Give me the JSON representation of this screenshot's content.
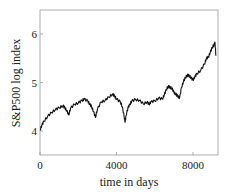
{
  "chart_data": {
    "type": "line",
    "title": "",
    "xlabel": "time in days",
    "ylabel": "S&P500 log index",
    "xlim": [
      0,
      9200
    ],
    "ylim": [
      3.5,
      6.5
    ],
    "xticks": [
      0,
      4000,
      8000
    ],
    "xtick_labels": [
      "0",
      "4000",
      "8000"
    ],
    "yticks": [
      4,
      5,
      6
    ],
    "ytick_labels": [
      "4",
      "5",
      "6"
    ],
    "grid": false,
    "legend": null,
    "series": [
      {
        "name": "S&P500 log index",
        "color": "#111111",
        "x": [
          0,
          100,
          200,
          400,
          600,
          800,
          1000,
          1200,
          1300,
          1400,
          1500,
          1600,
          1800,
          2000,
          2200,
          2300,
          2500,
          2600,
          2700,
          2800,
          2900,
          3000,
          3200,
          3400,
          3600,
          3800,
          3900,
          4000,
          4200,
          4300,
          4400,
          4450,
          4500,
          4600,
          4700,
          4800,
          5000,
          5200,
          5400,
          5600,
          5700,
          5800,
          6000,
          6200,
          6400,
          6500,
          6600,
          6700,
          6800,
          6900,
          7000,
          7100,
          7200,
          7300,
          7400,
          7500,
          7600,
          7700,
          7800,
          7900,
          8000,
          8100,
          8200,
          8400,
          8600,
          8700,
          8800,
          8900,
          9000,
          9100,
          9150,
          9200
        ],
        "y": [
          4.02,
          4.12,
          4.2,
          4.3,
          4.38,
          4.44,
          4.48,
          4.52,
          4.48,
          4.42,
          4.33,
          4.47,
          4.55,
          4.58,
          4.63,
          4.66,
          4.62,
          4.55,
          4.5,
          4.4,
          4.28,
          4.45,
          4.6,
          4.63,
          4.7,
          4.76,
          4.72,
          4.66,
          4.6,
          4.5,
          4.3,
          4.18,
          4.32,
          4.48,
          4.55,
          4.62,
          4.65,
          4.63,
          4.56,
          4.6,
          4.55,
          4.6,
          4.62,
          4.68,
          4.66,
          4.75,
          4.85,
          4.92,
          4.9,
          4.88,
          4.8,
          4.76,
          4.72,
          4.68,
          4.9,
          5.02,
          5.1,
          5.15,
          5.14,
          5.1,
          5.05,
          5.12,
          5.18,
          5.25,
          5.38,
          5.5,
          5.52,
          5.62,
          5.72,
          5.78,
          5.82,
          5.55
        ]
      }
    ]
  }
}
